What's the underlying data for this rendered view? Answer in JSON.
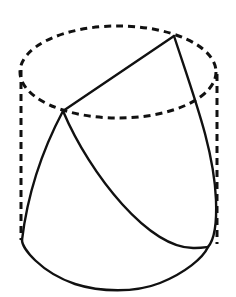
{
  "figure": {
    "stroke_color": "#111111",
    "background_color": "#ffffff",
    "cylinder": {
      "top_ellipse": {
        "cx": 118,
        "cy": 72,
        "rx": 98,
        "ry": 46,
        "style": "dashed"
      },
      "left_edge": {
        "x": 21,
        "y1": 70,
        "y2": 240,
        "style": "dashed"
      },
      "right_edge": {
        "x": 216,
        "y1": 72,
        "y2": 245,
        "style": "dashed"
      }
    },
    "cut": {
      "point_a": {
        "x": 63,
        "y": 111
      },
      "point_b": {
        "x": 174,
        "y": 36
      },
      "segments": [
        {
          "name": "chord-a-b",
          "style": "solid"
        },
        {
          "name": "curve-b-right-bottom",
          "style": "solid"
        },
        {
          "name": "curve-a-left-bottom",
          "style": "solid"
        },
        {
          "name": "curve-a-right-bottom",
          "style": "solid"
        },
        {
          "name": "bottom-arc",
          "style": "solid"
        }
      ]
    }
  }
}
